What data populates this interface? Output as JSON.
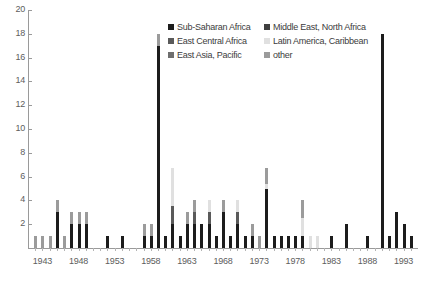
{
  "chart_data": {
    "type": "bar",
    "stacked": true,
    "title": "",
    "xlabel": "",
    "ylabel": "",
    "ylim": [
      0,
      20
    ],
    "ytick_step": 2,
    "yticks": [
      0,
      2,
      4,
      6,
      8,
      10,
      12,
      14,
      16,
      18,
      20
    ],
    "ytick_labels": [
      "",
      "2",
      "4",
      "6",
      "8",
      "10",
      "12",
      "14",
      "16",
      "18",
      "20"
    ],
    "grid": false,
    "xlim": [
      1941,
      1995
    ],
    "xtick_labels": [
      "1943",
      "1948",
      "1953",
      "1958",
      "1963",
      "1968",
      "1973",
      "1978",
      "1983",
      "1988",
      "1993"
    ],
    "xtick_values": [
      1943,
      1948,
      1953,
      1958,
      1963,
      1968,
      1973,
      1978,
      1983,
      1988,
      1993
    ],
    "legend_position": "top-center",
    "series": [
      {
        "name": "Sub-Saharan Africa",
        "color": "#1c1c1c"
      },
      {
        "name": "Middle East, North Africa",
        "color": "#3f3f3f"
      },
      {
        "name": "East Central Africa",
        "color": "#5a5a5a"
      },
      {
        "name": "Latin America, Caribbean",
        "color": "#e0e0e0"
      },
      {
        "name": "East Asia, Pacific",
        "color": "#6e6e6e"
      },
      {
        "name": "other",
        "color": "#9b9b9b"
      }
    ],
    "categories": [
      1942,
      1943,
      1944,
      1945,
      1946,
      1947,
      1948,
      1949,
      1950,
      1951,
      1952,
      1953,
      1954,
      1955,
      1956,
      1957,
      1958,
      1959,
      1960,
      1961,
      1962,
      1963,
      1964,
      1965,
      1966,
      1967,
      1968,
      1969,
      1970,
      1971,
      1972,
      1973,
      1974,
      1975,
      1976,
      1977,
      1978,
      1979,
      1980,
      1981,
      1982,
      1983,
      1984,
      1985,
      1986,
      1987,
      1988,
      1989,
      1990,
      1991,
      1992,
      1993,
      1994
    ],
    "values": [
      1.0,
      1.0,
      1.0,
      4.0,
      1.0,
      3.0,
      3.0,
      3.0,
      0.0,
      0.0,
      1.0,
      0.0,
      1.0,
      0.0,
      0.0,
      2.0,
      2.0,
      18.0,
      1.0,
      6.7,
      1.0,
      3.0,
      4.0,
      2.0,
      4.0,
      1.0,
      4.0,
      1.0,
      4.0,
      1.0,
      2.0,
      1.0,
      6.7,
      1.0,
      1.0,
      1.0,
      1.0,
      4.0,
      1.0,
      1.0,
      0.0,
      1.0,
      0.0,
      2.0,
      0.0,
      0.0,
      1.0,
      0.0,
      18.0,
      1.0,
      3.0,
      2.0,
      1.0
    ],
    "stack_detail": [
      {
        "year": 1942,
        "segments": [
          {
            "series": "other",
            "value": 1.0
          }
        ]
      },
      {
        "year": 1943,
        "segments": [
          {
            "series": "other",
            "value": 1.0
          }
        ]
      },
      {
        "year": 1944,
        "segments": [
          {
            "series": "other",
            "value": 1.0
          }
        ]
      },
      {
        "year": 1945,
        "segments": [
          {
            "series": "Sub-Saharan Africa",
            "value": 3.0
          },
          {
            "series": "other",
            "value": 1.0
          }
        ]
      },
      {
        "year": 1946,
        "segments": [
          {
            "series": "other",
            "value": 1.0
          }
        ]
      },
      {
        "year": 1947,
        "segments": [
          {
            "series": "Sub-Saharan Africa",
            "value": 2.0
          },
          {
            "series": "other",
            "value": 1.0
          }
        ]
      },
      {
        "year": 1948,
        "segments": [
          {
            "series": "Sub-Saharan Africa",
            "value": 2.0
          },
          {
            "series": "other",
            "value": 1.0
          }
        ]
      },
      {
        "year": 1949,
        "segments": [
          {
            "series": "Sub-Saharan Africa",
            "value": 2.0
          },
          {
            "series": "other",
            "value": 1.0
          }
        ]
      },
      {
        "year": 1952,
        "segments": [
          {
            "series": "Sub-Saharan Africa",
            "value": 1.0
          }
        ]
      },
      {
        "year": 1954,
        "segments": [
          {
            "series": "Sub-Saharan Africa",
            "value": 1.0
          }
        ]
      },
      {
        "year": 1957,
        "segments": [
          {
            "series": "Sub-Saharan Africa",
            "value": 1.0
          },
          {
            "series": "other",
            "value": 1.0
          }
        ]
      },
      {
        "year": 1958,
        "segments": [
          {
            "series": "Sub-Saharan Africa",
            "value": 1.0
          },
          {
            "series": "other",
            "value": 1.0
          }
        ]
      },
      {
        "year": 1959,
        "segments": [
          {
            "series": "Sub-Saharan Africa",
            "value": 17.0
          },
          {
            "series": "other",
            "value": 1.0
          }
        ]
      },
      {
        "year": 1960,
        "segments": [
          {
            "series": "Sub-Saharan Africa",
            "value": 1.0
          }
        ]
      },
      {
        "year": 1961,
        "segments": [
          {
            "series": "Sub-Saharan Africa",
            "value": 2.0
          },
          {
            "series": "East Central Africa",
            "value": 1.5
          },
          {
            "series": "Latin America, Caribbean",
            "value": 3.2
          }
        ]
      },
      {
        "year": 1962,
        "segments": [
          {
            "series": "Sub-Saharan Africa",
            "value": 1.0
          }
        ]
      },
      {
        "year": 1963,
        "segments": [
          {
            "series": "Sub-Saharan Africa",
            "value": 2.0
          },
          {
            "series": "other",
            "value": 1.0
          }
        ]
      },
      {
        "year": 1964,
        "segments": [
          {
            "series": "Sub-Saharan Africa",
            "value": 2.0
          },
          {
            "series": "East Central Africa",
            "value": 1.0
          },
          {
            "series": "other",
            "value": 1.0
          }
        ]
      },
      {
        "year": 1965,
        "segments": [
          {
            "series": "Sub-Saharan Africa",
            "value": 2.0
          }
        ]
      },
      {
        "year": 1966,
        "segments": [
          {
            "series": "Sub-Saharan Africa",
            "value": 2.0
          },
          {
            "series": "East Central Africa",
            "value": 1.0
          },
          {
            "series": "Latin America, Caribbean",
            "value": 1.0
          }
        ]
      },
      {
        "year": 1967,
        "segments": [
          {
            "series": "Sub-Saharan Africa",
            "value": 1.0
          }
        ]
      },
      {
        "year": 1968,
        "segments": [
          {
            "series": "Sub-Saharan Africa",
            "value": 3.0
          },
          {
            "series": "other",
            "value": 1.0
          }
        ]
      },
      {
        "year": 1969,
        "segments": [
          {
            "series": "Sub-Saharan Africa",
            "value": 1.0
          }
        ]
      },
      {
        "year": 1970,
        "segments": [
          {
            "series": "Sub-Saharan Africa",
            "value": 2.0
          },
          {
            "series": "East Central Africa",
            "value": 1.0
          },
          {
            "series": "Latin America, Caribbean",
            "value": 1.0
          }
        ]
      },
      {
        "year": 1971,
        "segments": [
          {
            "series": "Sub-Saharan Africa",
            "value": 1.0
          }
        ]
      },
      {
        "year": 1972,
        "segments": [
          {
            "series": "Sub-Saharan Africa",
            "value": 1.0
          },
          {
            "series": "other",
            "value": 1.0
          }
        ]
      },
      {
        "year": 1973,
        "segments": [
          {
            "series": "other",
            "value": 1.0
          }
        ]
      },
      {
        "year": 1974,
        "segments": [
          {
            "series": "Sub-Saharan Africa",
            "value": 5.0
          },
          {
            "series": "Latin America, Caribbean",
            "value": 0.4
          },
          {
            "series": "other",
            "value": 1.3
          }
        ]
      },
      {
        "year": 1975,
        "segments": [
          {
            "series": "Sub-Saharan Africa",
            "value": 1.0
          }
        ]
      },
      {
        "year": 1976,
        "segments": [
          {
            "series": "Sub-Saharan Africa",
            "value": 1.0
          }
        ]
      },
      {
        "year": 1977,
        "segments": [
          {
            "series": "Sub-Saharan Africa",
            "value": 1.0
          }
        ]
      },
      {
        "year": 1978,
        "segments": [
          {
            "series": "Sub-Saharan Africa",
            "value": 1.0
          }
        ]
      },
      {
        "year": 1979,
        "segments": [
          {
            "series": "Sub-Saharan Africa",
            "value": 1.0
          },
          {
            "series": "Latin America, Caribbean",
            "value": 1.5
          },
          {
            "series": "other",
            "value": 1.5
          }
        ]
      },
      {
        "year": 1980,
        "segments": [
          {
            "series": "Latin America, Caribbean",
            "value": 1.0
          }
        ]
      },
      {
        "year": 1981,
        "segments": [
          {
            "series": "Latin America, Caribbean",
            "value": 1.0
          }
        ]
      },
      {
        "year": 1983,
        "segments": [
          {
            "series": "Sub-Saharan Africa",
            "value": 1.0
          }
        ]
      },
      {
        "year": 1985,
        "segments": [
          {
            "series": "Sub-Saharan Africa",
            "value": 2.0
          }
        ]
      },
      {
        "year": 1988,
        "segments": [
          {
            "series": "Sub-Saharan Africa",
            "value": 1.0
          }
        ]
      },
      {
        "year": 1990,
        "segments": [
          {
            "series": "Sub-Saharan Africa",
            "value": 18.0
          }
        ]
      },
      {
        "year": 1991,
        "segments": [
          {
            "series": "Sub-Saharan Africa",
            "value": 1.0
          }
        ]
      },
      {
        "year": 1992,
        "segments": [
          {
            "series": "Sub-Saharan Africa",
            "value": 3.0
          }
        ]
      },
      {
        "year": 1993,
        "segments": [
          {
            "series": "Sub-Saharan Africa",
            "value": 2.0
          }
        ]
      },
      {
        "year": 1994,
        "segments": [
          {
            "series": "Sub-Saharan Africa",
            "value": 1.0
          }
        ]
      }
    ]
  },
  "legend": {
    "entries": [
      {
        "label": "Sub-Saharan Africa",
        "color": "#1c1c1c"
      },
      {
        "label": "Middle East, North Africa",
        "color": "#3f3f3f"
      },
      {
        "label": "East Central Africa",
        "color": "#5a5a5a"
      },
      {
        "label": "Latin America, Caribbean",
        "color": "#e0e0e0"
      },
      {
        "label": "East Asia, Pacific",
        "color": "#6e6e6e"
      },
      {
        "label": "other",
        "color": "#9b9b9b"
      }
    ]
  }
}
